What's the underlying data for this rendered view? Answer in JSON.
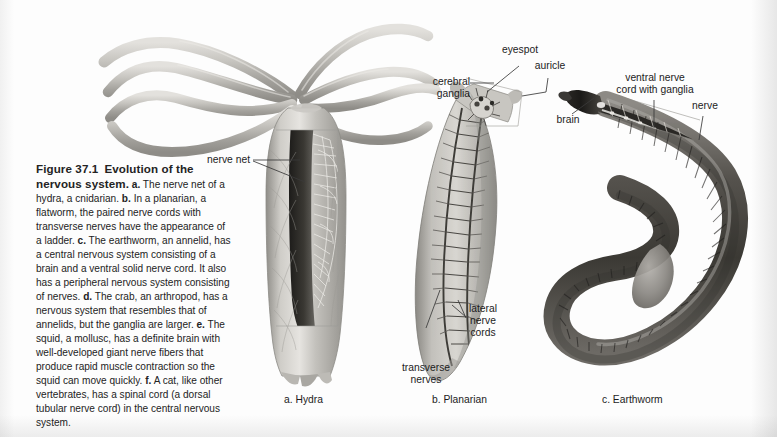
{
  "figure": {
    "number": "Figure 37.1",
    "title": "Evolution of the nervous system.",
    "caption_segments": [
      {
        "marker": "a.",
        "text": "The nerve net of a hydra, a cnidarian."
      },
      {
        "marker": "b.",
        "text": "In a planarian, a flatworm, the paired nerve cords with transverse nerves have the appearance of a ladder."
      },
      {
        "marker": "c.",
        "text": "The earthworm, an annelid, has a central nervous system consisting of a brain and a ventral solid nerve cord. It also has a peripheral nervous system consisting of nerves."
      },
      {
        "marker": "d.",
        "text": "The crab, an arthropod, has a nervous system that resembles that of annelids, but the ganglia are larger."
      },
      {
        "marker": "e.",
        "text": "The squid, a mollusc, has a definite brain with well-developed giant nerve fibers that produce rapid muscle contraction so the squid can move quickly."
      },
      {
        "marker": "f.",
        "text": "A cat, like other vertebrates, has a spinal cord (a dorsal tubular nerve cord) in the central nervous system."
      }
    ]
  },
  "panels": [
    {
      "id": "hydra",
      "label": "a. Hydra"
    },
    {
      "id": "planarian",
      "label": "b. Planarian"
    },
    {
      "id": "earthworm",
      "label": "c. Earthworm"
    }
  ],
  "labels": {
    "nerve_net": "nerve net",
    "eyespot": "eyespot",
    "auricle": "auricle",
    "cerebral_ganglia": "cerebral\nganglia",
    "lateral_nerve_cords": "lateral\nnerve\ncords",
    "transverse_nerves": "transverse\nnerves",
    "brain": "brain",
    "ventral_nerve_cord": "ventral nerve\ncord with ganglia",
    "nerve": "nerve"
  },
  "colors": {
    "background": "#fdfdfd",
    "text": "#1c1c1c",
    "leader_line": "#3a3a3a",
    "hydra_body": "#b9b7b2",
    "planarian_body": "#a8a6a1",
    "earthworm_body": "#6f6c67"
  }
}
